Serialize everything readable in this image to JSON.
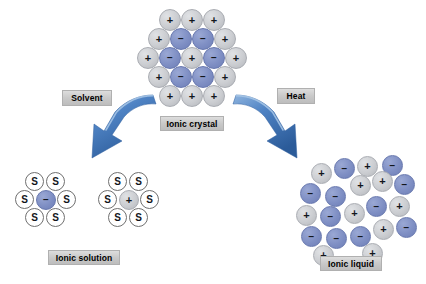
{
  "figure": {
    "background": "#ffffff"
  },
  "palette": {
    "cation_gray": "#c9cbcf",
    "anion_blue": "#7f8fc4",
    "solvent_white": "#ffffff",
    "arrow_blue_light": "#5b8fd0",
    "arrow_blue_dark": "#2e5f9e",
    "chip_gray": "#c9c9c9",
    "text_black": "#000000"
  },
  "signs": {
    "positive": "+",
    "negative": "−",
    "solvent": "S"
  },
  "captions": {
    "ionic_crystal": "Ionic crystal",
    "ionic_solution": "Ionic solution",
    "ionic_liquid": "Ionic liquid"
  },
  "steps": {
    "solvent": "Solvent",
    "heat": "Heat"
  },
  "ionic_crystal": {
    "label": "Ionic crystal",
    "description": "Ordered lattice of alternating positive (gray) and negative (blue) ions",
    "counts": {
      "positive": 13,
      "negative": 7,
      "total": 20
    },
    "ions": [
      {
        "charge": "+",
        "color": "gray",
        "x": 159,
        "y": 9,
        "d": 22
      },
      {
        "charge": "+",
        "color": "gray",
        "x": 181,
        "y": 9,
        "d": 22
      },
      {
        "charge": "+",
        "color": "gray",
        "x": 203,
        "y": 9,
        "d": 22
      },
      {
        "charge": "+",
        "color": "gray",
        "x": 148,
        "y": 28,
        "d": 22
      },
      {
        "charge": "−",
        "color": "blue",
        "x": 170,
        "y": 28,
        "d": 22
      },
      {
        "charge": "−",
        "color": "blue",
        "x": 192,
        "y": 28,
        "d": 22
      },
      {
        "charge": "+",
        "color": "gray",
        "x": 214,
        "y": 28,
        "d": 22
      },
      {
        "charge": "+",
        "color": "gray",
        "x": 137,
        "y": 47,
        "d": 22
      },
      {
        "charge": "−",
        "color": "blue",
        "x": 159,
        "y": 47,
        "d": 22
      },
      {
        "charge": "+",
        "color": "gray",
        "x": 181,
        "y": 47,
        "d": 22
      },
      {
        "charge": "−",
        "color": "blue",
        "x": 203,
        "y": 47,
        "d": 22
      },
      {
        "charge": "+",
        "color": "gray",
        "x": 225,
        "y": 47,
        "d": 22
      },
      {
        "charge": "+",
        "color": "gray",
        "x": 148,
        "y": 66,
        "d": 22
      },
      {
        "charge": "−",
        "color": "blue",
        "x": 170,
        "y": 66,
        "d": 22
      },
      {
        "charge": "−",
        "color": "blue",
        "x": 192,
        "y": 66,
        "d": 22
      },
      {
        "charge": "+",
        "color": "gray",
        "x": 214,
        "y": 66,
        "d": 22
      },
      {
        "charge": "+",
        "color": "gray",
        "x": 159,
        "y": 85,
        "d": 22
      },
      {
        "charge": "+",
        "color": "gray",
        "x": 181,
        "y": 85,
        "d": 22
      },
      {
        "charge": "+",
        "color": "gray",
        "x": 203,
        "y": 85,
        "d": 22
      }
    ]
  },
  "ionic_solution": {
    "label": "Ionic solution",
    "description": "Two solvated ions, each surrounded by six solvent molecules labelled S",
    "clusters": [
      {
        "name": "solvated-anion",
        "center": {
          "charge": "−",
          "color": "blue",
          "x": 36,
          "y": 190,
          "d": 20
        },
        "shell": [
          {
            "label": "S",
            "x": 25,
            "y": 172,
            "d": 19
          },
          {
            "label": "S",
            "x": 46,
            "y": 172,
            "d": 19
          },
          {
            "label": "S",
            "x": 15,
            "y": 190,
            "d": 19
          },
          {
            "label": "S",
            "x": 57,
            "y": 190,
            "d": 19
          },
          {
            "label": "S",
            "x": 25,
            "y": 208,
            "d": 19
          },
          {
            "label": "S",
            "x": 46,
            "y": 208,
            "d": 19
          }
        ]
      },
      {
        "name": "solvated-cation",
        "center": {
          "charge": "+",
          "color": "gray",
          "x": 119,
          "y": 190,
          "d": 20
        },
        "shell": [
          {
            "label": "S",
            "x": 108,
            "y": 172,
            "d": 19
          },
          {
            "label": "S",
            "x": 129,
            "y": 172,
            "d": 19
          },
          {
            "label": "S",
            "x": 98,
            "y": 190,
            "d": 19
          },
          {
            "label": "S",
            "x": 140,
            "y": 190,
            "d": 19
          },
          {
            "label": "S",
            "x": 108,
            "y": 208,
            "d": 19
          },
          {
            "label": "S",
            "x": 129,
            "y": 208,
            "d": 19
          }
        ]
      }
    ]
  },
  "ionic_liquid": {
    "label": "Ionic liquid",
    "description": "Disordered arrangement of positive (gray) and negative (blue) ions",
    "counts": {
      "positive": 10,
      "negative": 11,
      "total": 21
    },
    "ions": [
      {
        "charge": "+",
        "color": "gray",
        "x": 311,
        "y": 163,
        "d": 21
      },
      {
        "charge": "−",
        "color": "blue",
        "x": 334,
        "y": 158,
        "d": 21
      },
      {
        "charge": "+",
        "color": "gray",
        "x": 357,
        "y": 156,
        "d": 21
      },
      {
        "charge": "−",
        "color": "blue",
        "x": 382,
        "y": 155,
        "d": 21
      },
      {
        "charge": "−",
        "color": "blue",
        "x": 300,
        "y": 183,
        "d": 21
      },
      {
        "charge": "−",
        "color": "blue",
        "x": 325,
        "y": 186,
        "d": 21
      },
      {
        "charge": "+",
        "color": "gray",
        "x": 350,
        "y": 175,
        "d": 21
      },
      {
        "charge": "+",
        "color": "gray",
        "x": 372,
        "y": 171,
        "d": 21
      },
      {
        "charge": "−",
        "color": "blue",
        "x": 394,
        "y": 174,
        "d": 21
      },
      {
        "charge": "+",
        "color": "gray",
        "x": 296,
        "y": 205,
        "d": 21
      },
      {
        "charge": "−",
        "color": "blue",
        "x": 320,
        "y": 206,
        "d": 21
      },
      {
        "charge": "+",
        "color": "gray",
        "x": 344,
        "y": 203,
        "d": 21
      },
      {
        "charge": "−",
        "color": "blue",
        "x": 366,
        "y": 196,
        "d": 21
      },
      {
        "charge": "+",
        "color": "gray",
        "x": 389,
        "y": 196,
        "d": 21
      },
      {
        "charge": "−",
        "color": "blue",
        "x": 301,
        "y": 226,
        "d": 21
      },
      {
        "charge": "−",
        "color": "blue",
        "x": 326,
        "y": 228,
        "d": 21
      },
      {
        "charge": "−",
        "color": "blue",
        "x": 350,
        "y": 226,
        "d": 21
      },
      {
        "charge": "+",
        "color": "gray",
        "x": 373,
        "y": 219,
        "d": 21
      },
      {
        "charge": "−",
        "color": "blue",
        "x": 396,
        "y": 217,
        "d": 21
      },
      {
        "charge": "+",
        "color": "gray",
        "x": 313,
        "y": 245,
        "d": 21
      },
      {
        "charge": "+",
        "color": "gray",
        "x": 362,
        "y": 243,
        "d": 21
      }
    ]
  },
  "arrows": [
    {
      "name": "solvent-arrow",
      "direction": "down-left",
      "from": "ionic-crystal",
      "to": "ionic-solution"
    },
    {
      "name": "heat-arrow",
      "direction": "down-right",
      "from": "ionic-crystal",
      "to": "ionic-liquid"
    }
  ]
}
